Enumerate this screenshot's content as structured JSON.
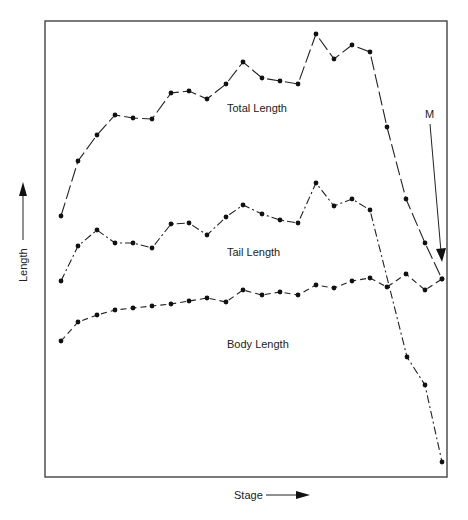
{
  "chart_data": {
    "type": "line",
    "title": "",
    "xlabel": "Stage",
    "ylabel": "Length",
    "grid": false,
    "legend": "inline labels",
    "x": [
      1,
      2,
      3,
      4,
      5,
      6,
      7,
      8,
      9,
      10,
      11,
      12,
      13,
      14,
      15,
      16,
      17,
      18,
      19,
      20,
      21,
      22
    ],
    "units_note": "relative length (0 = bottom of frame, 100 = top of frame); no tick labels shown",
    "ylim": [
      0,
      100
    ],
    "series": [
      {
        "name": "Total Length",
        "style": "solid with dashes",
        "values": [
          57,
          69,
          75,
          79,
          78,
          78,
          84,
          84,
          83,
          86,
          91,
          87,
          87,
          86,
          97,
          92,
          95,
          93,
          77,
          61,
          52,
          44
        ]
      },
      {
        "name": "Tail Length",
        "style": "dash-dot",
        "values": [
          43,
          50,
          54,
          51,
          51,
          50,
          55,
          55,
          53,
          57,
          60,
          58,
          56,
          56,
          64,
          59,
          61,
          58,
          26,
          20,
          null,
          3
        ]
      },
      {
        "name": "Body Length",
        "style": "dashed",
        "values": [
          30,
          34,
          36,
          37,
          37,
          38,
          38,
          39,
          40,
          39,
          41,
          40,
          41,
          40,
          42,
          42,
          43,
          44,
          42,
          45,
          41,
          44
        ]
      }
    ],
    "annotations": [
      {
        "text": "M",
        "type": "arrow",
        "points_to": "stage 22 (metamorphosis)"
      }
    ]
  },
  "labels": {
    "x_axis": "Stage",
    "y_axis": "Length",
    "total": "Total Length",
    "tail": "Tail Length",
    "body": "Body Length",
    "marker": "M"
  },
  "pixel_points": {
    "total": [
      [
        61,
        216
      ],
      [
        78,
        161
      ],
      [
        97,
        135
      ],
      [
        115,
        115
      ],
      [
        133,
        118
      ],
      [
        152,
        119
      ],
      [
        171,
        93
      ],
      [
        189,
        91
      ],
      [
        207,
        99
      ],
      [
        226,
        84
      ],
      [
        243,
        62
      ],
      [
        262,
        78
      ],
      [
        280,
        81
      ],
      [
        298,
        84
      ],
      [
        316,
        34
      ],
      [
        334,
        59
      ],
      [
        352,
        45
      ],
      [
        370,
        52
      ],
      [
        387,
        127
      ],
      [
        406,
        199
      ],
      [
        425,
        243
      ],
      [
        442,
        279
      ]
    ],
    "tail": [
      [
        61,
        281
      ],
      [
        78,
        246
      ],
      [
        97,
        230
      ],
      [
        115,
        243
      ],
      [
        133,
        243
      ],
      [
        152,
        248
      ],
      [
        171,
        224
      ],
      [
        189,
        223
      ],
      [
        207,
        235
      ],
      [
        226,
        217
      ],
      [
        243,
        205
      ],
      [
        262,
        214
      ],
      [
        280,
        220
      ],
      [
        298,
        223
      ],
      [
        316,
        183
      ],
      [
        334,
        206
      ],
      [
        352,
        199
      ],
      [
        370,
        210
      ],
      [
        407,
        357
      ],
      [
        425,
        385
      ],
      [
        442,
        462
      ]
    ],
    "body": [
      [
        61,
        341
      ],
      [
        78,
        322
      ],
      [
        97,
        315
      ],
      [
        115,
        310
      ],
      [
        133,
        308
      ],
      [
        152,
        306
      ],
      [
        171,
        304
      ],
      [
        189,
        301
      ],
      [
        207,
        298
      ],
      [
        226,
        302
      ],
      [
        243,
        290
      ],
      [
        262,
        295
      ],
      [
        280,
        292
      ],
      [
        298,
        295
      ],
      [
        316,
        285
      ],
      [
        334,
        288
      ],
      [
        352,
        281
      ],
      [
        370,
        278
      ],
      [
        387,
        287
      ],
      [
        406,
        274
      ],
      [
        425,
        290
      ],
      [
        442,
        279
      ]
    ]
  }
}
